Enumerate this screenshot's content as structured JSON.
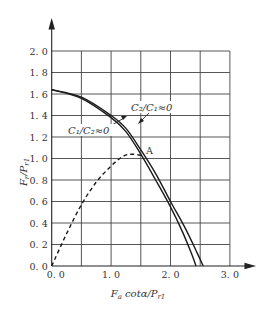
{
  "chart_data": {
    "type": "line",
    "title": "",
    "xlabel": "F_a cotα / P_r1",
    "ylabel": "F_r / P_r1",
    "xlim": [
      0,
      3.0
    ],
    "ylim": [
      0,
      2.0
    ],
    "grid": true,
    "x_ticks": [
      "0.0",
      "1.0",
      "2.0",
      "3.0"
    ],
    "x_grid_step": 0.5,
    "y_ticks": [
      "0.0",
      "0.2",
      "0.4",
      "0.6",
      "0.8",
      "1.0",
      "1.2",
      "1.4",
      "1.6",
      "1.8",
      "2.0"
    ],
    "series": [
      {
        "name": "C1/C2≈0",
        "style": "solid",
        "x": [
          0,
          0.5,
          1.0,
          1.25,
          1.5,
          1.75,
          2.0,
          2.2,
          2.35,
          2.43
        ],
        "y": [
          1.64,
          1.56,
          1.38,
          1.25,
          1.04,
          0.8,
          0.55,
          0.32,
          0.12,
          0
        ]
      },
      {
        "name": "C2/C1≈0",
        "style": "solid",
        "x": [
          0,
          0.5,
          1.0,
          1.25,
          1.5,
          1.75,
          2.0,
          2.25,
          2.45,
          2.55
        ],
        "y": [
          1.64,
          1.57,
          1.4,
          1.28,
          1.08,
          0.86,
          0.6,
          0.35,
          0.12,
          0
        ]
      },
      {
        "name": "dashed",
        "style": "dashed",
        "x": [
          0,
          0.25,
          0.5,
          0.75,
          1.0,
          1.2,
          1.35,
          1.5
        ],
        "y": [
          0,
          0.3,
          0.57,
          0.78,
          0.93,
          1.02,
          1.04,
          1.03
        ]
      }
    ],
    "annotations": [
      {
        "text": "C2/C1≈0",
        "x": 1.35,
        "y": 1.36
      },
      {
        "text": "C1/C2≈0",
        "x": 0.2,
        "y": 1.2
      },
      {
        "text": "A",
        "x": 1.55,
        "y": 1.03
      }
    ]
  },
  "labels": {
    "ylabel_main": "F",
    "ylabel_sub": "r",
    "ylabel_den": "/P",
    "ylabel_den_sub": "r1",
    "xlabel_main": "F",
    "xlabel_sub": "a",
    "xlabel_mid": " cotα/P",
    "xlabel_den_sub": "r1",
    "ann_c2c1": "C₂/C₁≈0",
    "ann_c1c2": "C₁/C₂≈0",
    "point_a": "A"
  }
}
